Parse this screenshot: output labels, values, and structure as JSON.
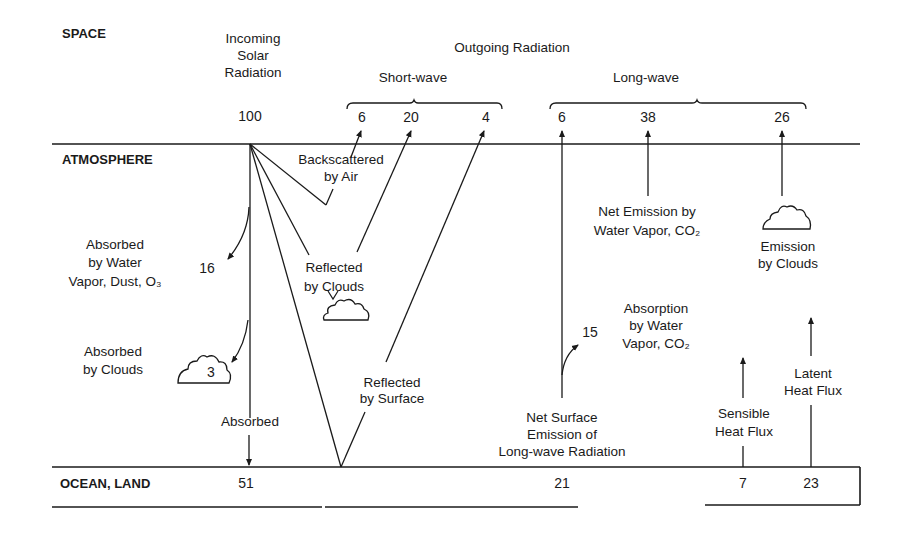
{
  "layers": {
    "space": "SPACE",
    "atmosphere": "ATMOSPHERE",
    "ocean_land": "OCEAN, LAND"
  },
  "incoming": {
    "label_lines": [
      "Incoming",
      "Solar",
      "Radiation"
    ],
    "value": "100"
  },
  "outgoing": {
    "title": "Outgoing Radiation",
    "shortwave": {
      "label": "Short-wave",
      "values": [
        "6",
        "20",
        "4"
      ]
    },
    "longwave": {
      "label": "Long-wave",
      "values": [
        "6",
        "38",
        "26"
      ]
    }
  },
  "atmosphere_labels": {
    "backscattered": [
      "Backscattered",
      "by Air"
    ],
    "absorbed_vapor": [
      "Absorbed",
      "by Water",
      "Vapor, Dust, O₃"
    ],
    "absorbed_vapor_value": "16",
    "reflected_clouds": [
      "Reflected",
      "by Clouds"
    ],
    "absorbed_clouds": [
      "Absorbed",
      "by Clouds"
    ],
    "absorbed_clouds_value": "3",
    "absorbed": "Absorbed",
    "reflected_surface": [
      "Reflected",
      "by  Surface"
    ],
    "net_emission": [
      "Net Emission by",
      "Water Vapor, CO₂"
    ],
    "emission_clouds": [
      "Emission",
      "by Clouds"
    ],
    "absorption_vapor": [
      "Absorption",
      "by Water",
      "Vapor, CO₂"
    ],
    "absorption_vapor_value": "15",
    "net_surface": [
      "Net Surface",
      "Emission of",
      "Long-wave Radiation"
    ],
    "sensible": [
      "Sensible",
      "Heat  Flux"
    ],
    "latent": [
      "Latent",
      "Heat Flux"
    ]
  },
  "surface_values": {
    "absorbed": "51",
    "net_surface": "21",
    "sensible": "7",
    "latent": "23"
  }
}
